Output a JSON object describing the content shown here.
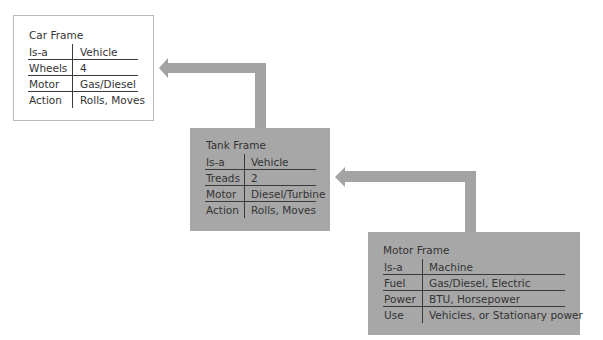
{
  "diagram": {
    "colors": {
      "frame_fill": "#a7a7a7",
      "arrow": "#a3a3a3",
      "text": "#333333",
      "car_border": "#b9b9b9"
    },
    "frames": [
      {
        "title": "Car Frame",
        "rows": [
          {
            "key": "Is-a",
            "value": "Vehicle"
          },
          {
            "key": "Wheels",
            "value": "4"
          },
          {
            "key": "Motor",
            "value": "Gas/Diesel"
          },
          {
            "key": "Action",
            "value": "Rolls, Moves"
          }
        ]
      },
      {
        "title": "Tank Frame",
        "rows": [
          {
            "key": "Is-a",
            "value": "Vehicle"
          },
          {
            "key": "Treads",
            "value": "2"
          },
          {
            "key": "Motor",
            "value": "Diesel/Turbine"
          },
          {
            "key": "Action",
            "value": "Rolls, Moves"
          }
        ]
      },
      {
        "title": "Motor Frame",
        "rows": [
          {
            "key": "Is-a",
            "value": "Machine"
          },
          {
            "key": "Fuel",
            "value": "Gas/Diesel, Electric"
          },
          {
            "key": "Power",
            "value": "BTU, Horsepower"
          },
          {
            "key": "Use",
            "value": "Vehicles, or Stationary power"
          }
        ]
      }
    ],
    "arrows": [
      {
        "from": "Tank Frame",
        "to": "Car Frame"
      },
      {
        "from": "Motor Frame",
        "to": "Tank Frame"
      }
    ]
  }
}
